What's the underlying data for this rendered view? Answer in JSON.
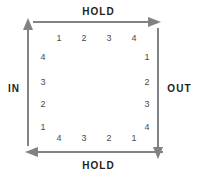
{
  "diagram": {
    "stroke_color": "#808285",
    "text_color": "#231f20",
    "number_color": "#4a4a4a",
    "background_color": "#ffffff",
    "edges": {
      "top": {
        "label": "HOLD",
        "direction": "right",
        "arrow_icon": "arrow-right-icon"
      },
      "bottom": {
        "label": "HOLD",
        "direction": "left",
        "arrow_icon": "arrow-left-icon"
      },
      "left": {
        "label": "IN",
        "direction": "up",
        "arrow_icon": "arrow-up-icon"
      },
      "right": {
        "label": "OUT",
        "direction": "down",
        "arrow_icon": "arrow-down-icon"
      }
    },
    "slots": {
      "top": [
        "1",
        "2",
        "3",
        "4"
      ],
      "right": [
        "1",
        "2",
        "3",
        "4"
      ],
      "bottom": [
        "4",
        "3",
        "2",
        "1"
      ],
      "left": [
        "4",
        "3",
        "2",
        "1"
      ]
    }
  }
}
